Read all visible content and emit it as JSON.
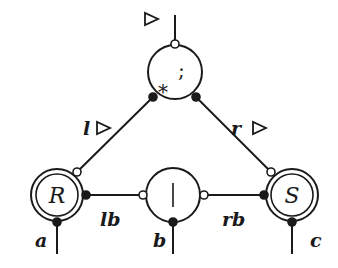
{
  "diagram": {
    "nodes": {
      "top": {
        "symbol": ";",
        "marker": "*"
      },
      "middle": {
        "symbol": "|"
      },
      "left": {
        "symbol": "R"
      },
      "right": {
        "symbol": "S"
      }
    },
    "edge_labels": {
      "l": "l",
      "r": "r",
      "lb": "lb",
      "rb": "rb",
      "a": "a",
      "b": "b",
      "c": "c"
    },
    "direction_marks": {
      "top": "▷",
      "l": "▷",
      "r": "▷"
    }
  }
}
